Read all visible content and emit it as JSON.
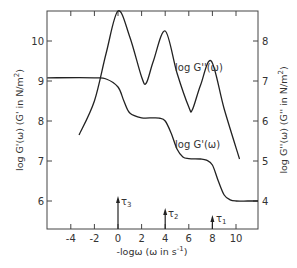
{
  "chart_data": {
    "type": "line",
    "title": "",
    "xlabel": "-logω (ω in s⁻¹)",
    "ylabel_left": "log G'(ω) (G' in N/m²)",
    "ylabel_right": "log G''(ω) (G'' in N/m²)",
    "xlim": [
      -6,
      12
    ],
    "ylim_left": [
      5.3,
      10.75
    ],
    "ylim_right": [
      3.3,
      8.75
    ],
    "grid": false,
    "x_ticks": [
      -4,
      -2,
      0,
      2,
      4,
      6,
      8,
      10
    ],
    "y_ticks_left": [
      6,
      7,
      8,
      9,
      10
    ],
    "y_ticks_right": [
      4,
      5,
      6,
      7,
      8
    ],
    "series": [
      {
        "name": "log G'(ω)",
        "axis": "left",
        "x": [
          -6,
          -2,
          -1,
          0,
          0.5,
          1,
          2,
          3,
          3.5,
          4,
          4.5,
          5,
          5.5,
          6,
          7,
          7.5,
          8,
          8.5,
          9,
          9.5,
          10,
          11,
          12
        ],
        "y": [
          9.08,
          9.08,
          9.05,
          8.85,
          8.5,
          8.2,
          8.08,
          8.08,
          8.07,
          8.0,
          7.7,
          7.3,
          7.1,
          7.06,
          7.05,
          7.02,
          6.9,
          6.5,
          6.15,
          6.03,
          6.0,
          6.0,
          6.0
        ],
        "label": "log G'(ω)"
      },
      {
        "name": "log G''(ω)",
        "axis": "right",
        "x": [
          -3.3,
          -2,
          -1,
          0,
          1,
          2,
          2.4,
          3,
          4,
          5,
          6,
          6.3,
          7,
          7.9,
          9,
          10.3
        ],
        "y": [
          5.65,
          6.5,
          7.7,
          8.75,
          8.1,
          7.1,
          6.95,
          7.5,
          8.25,
          7.2,
          6.35,
          6.28,
          6.9,
          7.5,
          6.3,
          5.05
        ],
        "label": "log G''(ω)"
      }
    ],
    "annotations": [
      {
        "text": "τ3",
        "x": 0,
        "type": "arrow"
      },
      {
        "text": "τ2",
        "x": 4,
        "type": "arrow"
      },
      {
        "text": "τ1",
        "x": 8,
        "type": "arrow"
      }
    ]
  },
  "labels": {
    "xlabel_main": "-logω (ω in s",
    "xlabel_sup": "-1",
    "xlabel_end": ")",
    "ylabel_left_main": "log G'(ω) (G' in N/m",
    "ylabel_right_main": "log G''(ω) (G'' in N/m",
    "ylabel_sup": "2",
    "ylabel_end": ")",
    "curve_gpp": "log G''(ω)",
    "curve_gp": "log G'(ω)",
    "tau3": "τ",
    "tau3_sub": "3",
    "tau2": "τ",
    "tau2_sub": "2",
    "tau1": "τ",
    "tau1_sub": "1"
  }
}
